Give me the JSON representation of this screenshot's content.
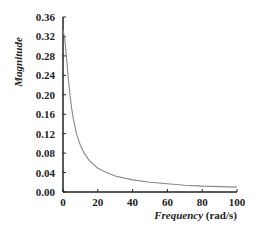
{
  "chart_data": {
    "type": "line",
    "title": "",
    "xlabel": "Frequency",
    "xlabel_unit": "(rad/s)",
    "ylabel": "Magnitude",
    "xlim": [
      0,
      100
    ],
    "ylim": [
      0,
      0.36
    ],
    "x_ticks": [
      0,
      20,
      40,
      60,
      80,
      100
    ],
    "x_tick_labels": [
      "0",
      "20",
      "40",
      "60",
      "80",
      "100"
    ],
    "y_ticks": [
      0,
      0.04,
      0.08,
      0.12,
      0.16,
      0.2,
      0.24,
      0.28,
      0.32,
      0.36
    ],
    "y_tick_labels": [
      "0.00",
      "0.04",
      "0.08",
      "0.12",
      "0.16",
      "0.20",
      "0.24",
      "0.28",
      "0.32",
      "0.36"
    ],
    "grid": false,
    "legend": null,
    "series": [
      {
        "name": "Magnitude",
        "color": "#888888",
        "x": [
          0,
          1,
          2,
          3,
          4,
          5,
          6,
          8,
          10,
          12,
          15,
          20,
          25,
          30,
          40,
          50,
          60,
          70,
          80,
          90,
          100
        ],
        "values": [
          0.333,
          0.316,
          0.277,
          0.236,
          0.2,
          0.171,
          0.149,
          0.117,
          0.096,
          0.081,
          0.065,
          0.049,
          0.04,
          0.033,
          0.025,
          0.02,
          0.017,
          0.014,
          0.012,
          0.011,
          0.01
        ]
      }
    ]
  }
}
